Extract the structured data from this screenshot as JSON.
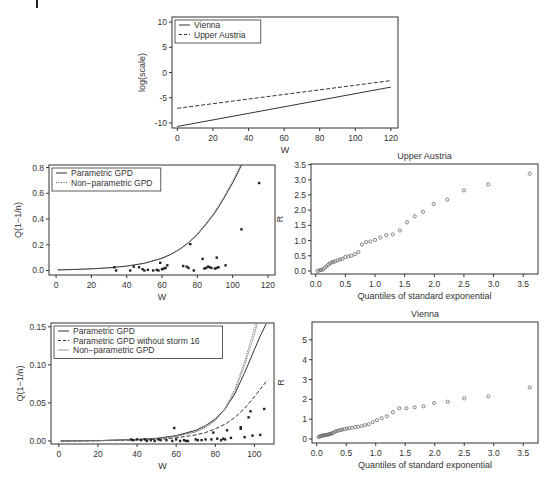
{
  "figure": {
    "panels": [
      {
        "id": "top",
        "box": [
          172,
          17,
          398,
          128
        ]
      },
      {
        "id": "mid_left",
        "box": [
          49,
          165,
          275,
          275
        ]
      },
      {
        "id": "mid_right",
        "box": [
          311,
          164,
          538,
          274
        ]
      },
      {
        "id": "bot_left",
        "box": [
          51,
          323,
          274,
          444
        ]
      },
      {
        "id": "bot_right",
        "box": [
          312,
          322,
          538,
          443
        ]
      }
    ]
  },
  "chart_data": [
    {
      "id": "top",
      "type": "line",
      "title": "",
      "xlabel": "W",
      "ylabel": "log(scale)",
      "xlim": [
        -3,
        124
      ],
      "ylim": [
        -11,
        11
      ],
      "xticks": [
        0,
        20,
        40,
        60,
        80,
        100,
        120
      ],
      "yticks": [
        -10,
        -5,
        0,
        5,
        10
      ],
      "legend": {
        "position": "top-left",
        "entries": [
          {
            "label": "Vienna",
            "style": "solid"
          },
          {
            "label": "Upper Austria",
            "style": "dashed"
          }
        ]
      },
      "series": [
        {
          "name": "Vienna",
          "style": "solid",
          "x": [
            0,
            120
          ],
          "y": [
            -10.7,
            -2.9
          ]
        },
        {
          "name": "Upper Austria",
          "style": "dashed",
          "x": [
            0,
            120
          ],
          "y": [
            -7.1,
            -1.6
          ]
        }
      ]
    },
    {
      "id": "mid_left",
      "type": "scatter",
      "title": "",
      "xlabel": "W",
      "ylabel": "Q(1−1/n)",
      "xlim": [
        -4,
        124
      ],
      "ylim": [
        -0.035,
        0.82
      ],
      "xticks": [
        0,
        20,
        40,
        60,
        80,
        100,
        120
      ],
      "yticks": [
        0.0,
        0.2,
        0.4,
        0.6,
        0.8
      ],
      "ytick_labels": [
        "0.0",
        "0.2",
        "0.4",
        "0.6",
        "0.8"
      ],
      "legend": {
        "position": "top-left",
        "entries": [
          {
            "label": "Parametric GPD",
            "style": "solid"
          },
          {
            "label": "Non−parametric GPD",
            "style": "dotted"
          }
        ]
      },
      "series": [
        {
          "name": "Parametric GPD",
          "style": "solid",
          "x": [
            1,
            10,
            20,
            30,
            40,
            50,
            60,
            65,
            70,
            75,
            80,
            85,
            90,
            95,
            100,
            103,
            105
          ],
          "y": [
            0.005,
            0.008,
            0.013,
            0.021,
            0.034,
            0.056,
            0.095,
            0.125,
            0.165,
            0.215,
            0.28,
            0.36,
            0.45,
            0.56,
            0.68,
            0.76,
            0.82
          ]
        },
        {
          "name": "Non−parametric GPD",
          "style": "dotted",
          "x": [
            1,
            10,
            20,
            30,
            40,
            50,
            60,
            65,
            70,
            75,
            80,
            85,
            90,
            95,
            100,
            103,
            104.5
          ],
          "y": [
            0.005,
            0.008,
            0.013,
            0.021,
            0.034,
            0.056,
            0.096,
            0.126,
            0.167,
            0.218,
            0.284,
            0.366,
            0.458,
            0.57,
            0.695,
            0.78,
            0.82
          ]
        },
        {
          "name": "observations",
          "style": "points",
          "x": [
            33,
            34,
            42,
            44,
            47,
            49,
            50,
            52,
            55,
            57,
            58,
            59,
            60,
            61,
            62,
            63,
            72,
            74,
            75,
            76,
            78,
            83,
            84,
            85,
            86,
            87,
            88,
            90,
            91,
            91,
            92,
            96,
            105,
            115
          ],
          "y": [
            0.025,
            0.0,
            0.0,
            0.03,
            0.025,
            0.01,
            0.0,
            0.005,
            0.0,
            0.005,
            0.0,
            0.06,
            0.01,
            0.015,
            0.02,
            0.04,
            0.035,
            0.03,
            0.02,
            0.205,
            0.0,
            0.09,
            0.015,
            0.02,
            0.03,
            0.025,
            0.02,
            0.015,
            0.02,
            0.1,
            0.025,
            0.04,
            0.32,
            0.68
          ]
        }
      ]
    },
    {
      "id": "mid_right",
      "type": "scatter",
      "title": "Upper Austria",
      "xlabel": "Quantiles of standard exponential",
      "ylabel": "R",
      "xlim": [
        -0.08,
        3.75
      ],
      "ylim": [
        -0.1,
        3.52
      ],
      "xticks": [
        0.0,
        0.5,
        1.0,
        1.5,
        2.0,
        2.5,
        3.0,
        3.5
      ],
      "xtick_labels": [
        "0.0",
        "0.5",
        "1.0",
        "1.5",
        "2.0",
        "2.5",
        "3.0",
        "3.5"
      ],
      "yticks": [
        0.0,
        0.5,
        1.0,
        1.5,
        2.0,
        2.5,
        3.0,
        3.5
      ],
      "ytick_labels": [
        "0.0",
        "0.5",
        "1.0",
        "1.5",
        "2.0",
        "2.5",
        "3.0",
        "3.5"
      ],
      "series": [
        {
          "name": "Upper Austria",
          "style": "open-circles",
          "x": [
            0.03,
            0.06,
            0.09,
            0.12,
            0.15,
            0.18,
            0.21,
            0.24,
            0.27,
            0.3,
            0.33,
            0.37,
            0.41,
            0.45,
            0.5,
            0.55,
            0.6,
            0.66,
            0.72,
            0.78,
            0.85,
            0.92,
            1.0,
            1.09,
            1.19,
            1.3,
            1.42,
            1.54,
            1.67,
            1.81,
            1.99,
            2.22,
            2.5,
            2.91,
            3.61
          ],
          "y": [
            0.0,
            0.02,
            0.03,
            0.05,
            0.1,
            0.15,
            0.2,
            0.25,
            0.28,
            0.3,
            0.32,
            0.35,
            0.38,
            0.4,
            0.46,
            0.48,
            0.5,
            0.55,
            0.62,
            0.87,
            0.95,
            0.97,
            1.02,
            1.1,
            1.18,
            1.2,
            1.33,
            1.6,
            1.8,
            1.95,
            2.2,
            2.35,
            2.65,
            2.85,
            3.2,
            3.38
          ]
        }
      ]
    },
    {
      "id": "bot_left",
      "type": "scatter",
      "title": "",
      "xlabel": "W",
      "ylabel": "Q(1−1/n)",
      "xlim": [
        -4,
        110
      ],
      "ylim": [
        -0.004,
        0.155
      ],
      "xticks": [
        0,
        20,
        40,
        60,
        80,
        100
      ],
      "yticks": [
        0.0,
        0.05,
        0.1,
        0.15
      ],
      "ytick_labels": [
        "0.00",
        "0.05",
        "0.10",
        "0.15"
      ],
      "legend": {
        "position": "top-left",
        "entries": [
          {
            "label": "Parametric GPD",
            "style": "solid"
          },
          {
            "label": "Parametric GPD without storm 16",
            "style": "dashed"
          },
          {
            "label": "Non−parametric GPD",
            "style": "light-solid"
          }
        ]
      },
      "series": [
        {
          "name": "Parametric GPD",
          "style": "solid",
          "x": [
            1,
            20,
            40,
            50,
            60,
            70,
            75,
            80,
            85,
            90,
            95,
            100,
            103,
            106
          ],
          "y": [
            0.0,
            0.0005,
            0.002,
            0.0035,
            0.007,
            0.014,
            0.02,
            0.029,
            0.042,
            0.062,
            0.09,
            0.12,
            0.138,
            0.154
          ]
        },
        {
          "name": "Parametric GPD without storm 16",
          "style": "dashed",
          "x": [
            1,
            20,
            40,
            50,
            60,
            70,
            75,
            80,
            85,
            90,
            95,
            100,
            103,
            106
          ],
          "y": [
            0.0,
            0.0003,
            0.0012,
            0.002,
            0.004,
            0.008,
            0.011,
            0.016,
            0.022,
            0.031,
            0.043,
            0.058,
            0.068,
            0.078
          ]
        },
        {
          "name": "Non−parametric GPD",
          "style": "light-solid",
          "x": [
            1,
            20,
            40,
            50,
            60,
            70,
            75,
            80,
            85,
            90,
            95,
            100,
            102
          ],
          "y": [
            0.0,
            0.0004,
            0.0018,
            0.003,
            0.006,
            0.012,
            0.018,
            0.027,
            0.042,
            0.065,
            0.1,
            0.14,
            0.16
          ]
        },
        {
          "name": "Non−parametric GPD (dotted)",
          "style": "dotted",
          "x": [
            1,
            20,
            40,
            50,
            60,
            70,
            75,
            80,
            85,
            90,
            95,
            100,
            101.5
          ],
          "y": [
            0.0,
            0.0004,
            0.0018,
            0.003,
            0.006,
            0.012,
            0.018,
            0.027,
            0.043,
            0.068,
            0.105,
            0.148,
            0.158
          ]
        },
        {
          "name": "observations",
          "style": "points",
          "x": [
            37,
            38,
            40,
            42,
            44,
            45,
            47,
            49,
            51,
            52,
            55,
            58,
            59,
            60,
            62,
            64,
            65,
            66,
            70,
            71,
            73,
            75,
            78,
            79,
            81,
            83,
            84,
            85,
            86,
            88,
            93,
            93,
            95,
            97,
            98,
            99,
            103,
            105
          ],
          "y": [
            0.002,
            0.001,
            0.002,
            0.001,
            0.002,
            0.0,
            0.001,
            0.0,
            0.002,
            0.001,
            0.001,
            0.0,
            0.017,
            0.002,
            0.0,
            0.001,
            0.0,
            0.0,
            0.002,
            0.001,
            0.001,
            0.002,
            0.002,
            0.011,
            0.003,
            0.001,
            0.003,
            0.002,
            0.014,
            0.004,
            0.016,
            0.018,
            0.005,
            0.031,
            0.039,
            0.007,
            0.008,
            0.042
          ]
        }
      ]
    },
    {
      "id": "bot_right",
      "type": "scatter",
      "title": "Vienna",
      "xlabel": "Quantiles of standard exponential",
      "ylabel": "R",
      "xlim": [
        -0.08,
        3.75
      ],
      "ylim": [
        -0.2,
        5.9
      ],
      "xticks": [
        0.0,
        0.5,
        1.0,
        1.5,
        2.0,
        2.5,
        3.0,
        3.5
      ],
      "xtick_labels": [
        "0.0",
        "0.5",
        "1.0",
        "1.5",
        "2.0",
        "2.5",
        "3.0",
        "3.5"
      ],
      "yticks": [
        0,
        1,
        2,
        3,
        4,
        5
      ],
      "ytick_labels": [
        "0",
        "1",
        "2",
        "3",
        "4",
        "5"
      ],
      "series": [
        {
          "name": "Vienna",
          "style": "open-circles",
          "x": [
            0.03,
            0.05,
            0.07,
            0.09,
            0.11,
            0.13,
            0.15,
            0.17,
            0.19,
            0.21,
            0.23,
            0.25,
            0.27,
            0.3,
            0.33,
            0.36,
            0.4,
            0.43,
            0.47,
            0.51,
            0.55,
            0.6,
            0.65,
            0.7,
            0.76,
            0.82,
            0.88,
            0.95,
            1.02,
            1.1,
            1.19,
            1.29,
            1.4,
            1.52,
            1.66,
            1.81,
            1.99,
            2.22,
            2.5,
            2.91,
            3.61
          ],
          "y": [
            0.1,
            0.13,
            0.15,
            0.17,
            0.18,
            0.19,
            0.2,
            0.21,
            0.22,
            0.24,
            0.26,
            0.28,
            0.3,
            0.35,
            0.4,
            0.42,
            0.45,
            0.47,
            0.5,
            0.52,
            0.55,
            0.57,
            0.6,
            0.62,
            0.65,
            0.7,
            0.75,
            0.85,
            0.95,
            1.05,
            1.15,
            1.35,
            1.55,
            1.55,
            1.6,
            1.65,
            1.82,
            1.88,
            2.05,
            2.15,
            2.6,
            5.7
          ]
        }
      ]
    }
  ]
}
